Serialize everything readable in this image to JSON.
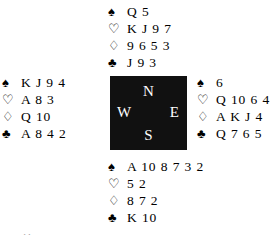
{
  "diagram": {
    "type": "bridge-deal-diagram",
    "suit_glyphs": {
      "spade": "♠",
      "heart": "♡",
      "diamond": "♢",
      "club": "♣"
    },
    "suit_order": [
      "spade",
      "heart",
      "diamond",
      "club"
    ],
    "compass": {
      "north": "N",
      "west": "W",
      "east": "E",
      "south": "S",
      "box_color": "#111111",
      "letter_color": "#ffffff"
    },
    "hands": {
      "north": {
        "label": "North",
        "spades": "Q 5",
        "hearts": "K J 9 7",
        "diamonds": "9 6 5 3",
        "clubs": "J 9 3"
      },
      "west": {
        "label": "West",
        "spades": "K J 9 4",
        "hearts": "A 8 3",
        "diamonds": "Q 10",
        "clubs": "A 8 4 2"
      },
      "east": {
        "label": "East",
        "spades": "6",
        "hearts": "Q 10 6 4",
        "diamonds": "A K J 4",
        "clubs": "Q 7 6 5"
      },
      "south": {
        "label": "South",
        "spades": "A 10 8 7 3 2",
        "hearts": "5 2",
        "diamonds": "8 7 2",
        "clubs": "K 10"
      }
    },
    "caption": "one table:"
  }
}
